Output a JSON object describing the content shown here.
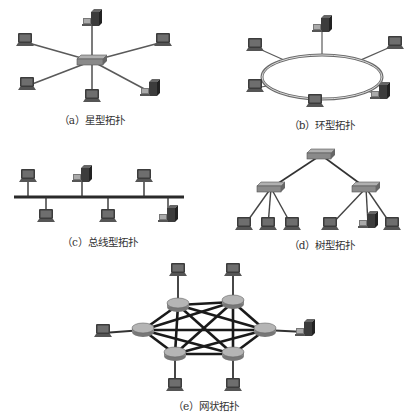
{
  "colors": {
    "link": "#5a5a5a",
    "ring": "#6a6a6a",
    "device": "#3c3c3c",
    "screen": "#6e6e6e",
    "hub": "#8a8a8a",
    "mesh_link": "#1a1a1a"
  },
  "captions": {
    "star": "（a）星型拓扑",
    "ring": "（b）环型拓扑",
    "bus": "（c）总线型拓扑",
    "tree": "（d）树型拓扑",
    "mesh": "（e）网状拓扑"
  },
  "diagrams": {
    "star": {
      "hub": [
        92,
        61
      ],
      "nodes": [
        {
          "type": "server",
          "pos": [
            92,
            22
          ]
        },
        {
          "type": "laptop",
          "pos": [
            25,
            42
          ]
        },
        {
          "type": "laptop",
          "pos": [
            163,
            42
          ]
        },
        {
          "type": "laptop",
          "pos": [
            27,
            86
          ]
        },
        {
          "type": "laptop",
          "pos": [
            92,
            98
          ]
        },
        {
          "type": "server",
          "pos": [
            150,
            92
          ]
        }
      ]
    },
    "ring": {
      "center": [
        322,
        77
      ],
      "rx": 60,
      "ry": 22,
      "nodes": [
        {
          "type": "server",
          "pos": [
            322,
            28
          ]
        },
        {
          "type": "laptop",
          "pos": [
            255,
            47
          ]
        },
        {
          "type": "laptop",
          "pos": [
            395,
            45
          ]
        },
        {
          "type": "laptop",
          "pos": [
            255,
            88
          ]
        },
        {
          "type": "laptop",
          "pos": [
            315,
            103
          ]
        },
        {
          "type": "server",
          "pos": [
            380,
            95
          ]
        }
      ]
    },
    "bus": {
      "line": [
        14,
        197,
        184
      ],
      "nodes": [
        {
          "type": "laptop",
          "pos": [
            28,
            178
          ]
        },
        {
          "type": "server",
          "pos": [
            82,
            178
          ]
        },
        {
          "type": "laptop",
          "pos": [
            144,
            178
          ]
        },
        {
          "type": "laptop",
          "pos": [
            46,
            218
          ]
        },
        {
          "type": "laptop",
          "pos": [
            108,
            218
          ]
        },
        {
          "type": "server",
          "pos": [
            168,
            218
          ]
        }
      ]
    },
    "tree": {
      "root": [
        321,
        155
      ],
      "switches": [
        [
          271,
          188
        ],
        [
          366,
          188
        ]
      ],
      "leaves": [
        {
          "type": "laptop",
          "pos": [
            244,
            226
          ],
          "parent": 0
        },
        {
          "type": "laptop",
          "pos": [
            268,
            226
          ],
          "parent": 0
        },
        {
          "type": "laptop",
          "pos": [
            292,
            226
          ],
          "parent": 0
        },
        {
          "type": "laptop",
          "pos": [
            330,
            226
          ],
          "parent": 1
        },
        {
          "type": "server",
          "pos": [
            368,
            224
          ],
          "parent": 1
        },
        {
          "type": "laptop",
          "pos": [
            392,
            226
          ],
          "parent": 1
        }
      ]
    },
    "mesh": {
      "routers": [
        [
          178,
          305
        ],
        [
          233,
          302
        ],
        [
          143,
          330
        ],
        [
          265,
          330
        ],
        [
          175,
          354
        ],
        [
          233,
          354
        ]
      ],
      "nodes": [
        {
          "type": "laptop",
          "pos": [
            178,
            272
          ],
          "router": 0
        },
        {
          "type": "laptop",
          "pos": [
            233,
            272
          ],
          "router": 1
        },
        {
          "type": "laptop",
          "pos": [
            103,
            333
          ],
          "router": 2
        },
        {
          "type": "server",
          "pos": [
            305,
            332
          ],
          "router": 3
        },
        {
          "type": "laptop",
          "pos": [
            175,
            387
          ],
          "router": 4
        },
        {
          "type": "laptop",
          "pos": [
            233,
            387
          ],
          "router": 5
        }
      ]
    }
  }
}
